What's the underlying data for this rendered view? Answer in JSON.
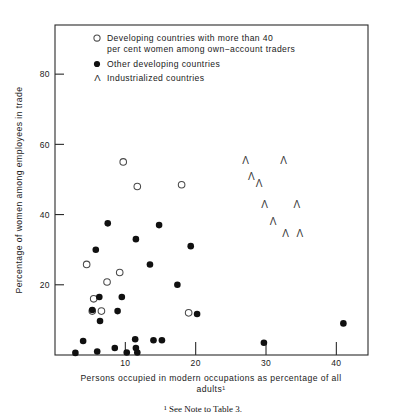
{
  "figure": {
    "footnote": "¹ See Note to Table 3."
  },
  "legend": {
    "position": "top-inside",
    "entries": [
      {
        "marker": "open-circle",
        "line1": "Developing countries with more than 40",
        "line2": "per cent women among own−account traders"
      },
      {
        "marker": "filled-circle",
        "line1": "Other developing countries",
        "line2": ""
      },
      {
        "marker": "triangle",
        "line1": "Industrialized countries",
        "line2": ""
      }
    ]
  },
  "chart_data": {
    "type": "scatter",
    "title": "",
    "xlabel": "Persons occupied in modern occupations as percentage of all adults¹",
    "xlabel_line1": "Persons occupied in modern occupations as percentage of all",
    "xlabel_line2": "adults¹",
    "ylabel": "Percentage of women among employees in trade",
    "xlim": [
      0,
      44.5
    ],
    "ylim": [
      0,
      94
    ],
    "xticks": [
      10,
      20,
      30,
      40
    ],
    "yticks": [
      20,
      40,
      60,
      80
    ],
    "xticklabels": [
      "10",
      "20",
      "30",
      "40"
    ],
    "yticklabels": [
      "20",
      "40",
      "60",
      "80"
    ],
    "grid": false,
    "series": [
      {
        "name": "Developing countries with more than 40 per cent women among own−account traders",
        "marker": "open-circle",
        "color": "#ffffff",
        "edge_color": "#4a4a4a",
        "points": [
          {
            "x": 9.7,
            "y": 55.0
          },
          {
            "x": 11.7,
            "y": 48.0
          },
          {
            "x": 18.0,
            "y": 48.5
          },
          {
            "x": 4.5,
            "y": 25.8
          },
          {
            "x": 9.2,
            "y": 23.5
          },
          {
            "x": 7.4,
            "y": 20.8
          },
          {
            "x": 5.5,
            "y": 16.0
          },
          {
            "x": 5.3,
            "y": 12.5
          },
          {
            "x": 6.6,
            "y": 12.5
          },
          {
            "x": 19.0,
            "y": 12.0
          }
        ]
      },
      {
        "name": "Other developing countries",
        "marker": "filled-circle",
        "color": "#101010",
        "points": [
          {
            "x": 7.5,
            "y": 37.5
          },
          {
            "x": 11.5,
            "y": 33.0
          },
          {
            "x": 14.8,
            "y": 37.0
          },
          {
            "x": 19.3,
            "y": 31.0
          },
          {
            "x": 5.8,
            "y": 30.0
          },
          {
            "x": 13.5,
            "y": 25.8
          },
          {
            "x": 6.3,
            "y": 16.5
          },
          {
            "x": 9.5,
            "y": 16.5
          },
          {
            "x": 5.3,
            "y": 12.8
          },
          {
            "x": 8.9,
            "y": 12.5
          },
          {
            "x": 6.4,
            "y": 9.7
          },
          {
            "x": 17.4,
            "y": 20.0
          },
          {
            "x": 20.2,
            "y": 11.7
          },
          {
            "x": 41.0,
            "y": 9.0
          },
          {
            "x": 29.7,
            "y": 3.5
          },
          {
            "x": 4.0,
            "y": 4.0
          },
          {
            "x": 8.5,
            "y": 2.0
          },
          {
            "x": 11.5,
            "y": 2.0
          },
          {
            "x": 11.4,
            "y": 4.5
          },
          {
            "x": 14.0,
            "y": 4.2
          },
          {
            "x": 15.2,
            "y": 4.2
          },
          {
            "x": 2.9,
            "y": 0.6
          },
          {
            "x": 6.0,
            "y": 1.0
          },
          {
            "x": 10.2,
            "y": 0.7
          },
          {
            "x": 11.7,
            "y": 0.7
          }
        ]
      },
      {
        "name": "Industrialized countries",
        "marker": "triangle",
        "color": "#3a3a3a",
        "points": [
          {
            "x": 27.1,
            "y": 55.5
          },
          {
            "x": 32.5,
            "y": 55.5
          },
          {
            "x": 27.9,
            "y": 50.8
          },
          {
            "x": 29.0,
            "y": 49.0
          },
          {
            "x": 29.8,
            "y": 43.0
          },
          {
            "x": 34.4,
            "y": 43.0
          },
          {
            "x": 31.0,
            "y": 38.0
          },
          {
            "x": 32.8,
            "y": 34.5
          },
          {
            "x": 34.8,
            "y": 34.5
          }
        ]
      }
    ]
  }
}
